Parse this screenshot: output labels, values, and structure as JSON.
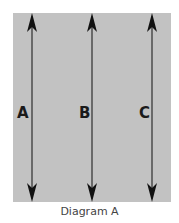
{
  "diagram": {
    "caption": "Diagram A",
    "background_color": "#c2c2c2",
    "arrow_color": "#111111",
    "arrows": [
      {
        "label": "A",
        "x": 32,
        "direction": "double-headed vertical"
      },
      {
        "label": "B",
        "x": 92,
        "direction": "double-headed vertical"
      },
      {
        "label": "C",
        "x": 152,
        "direction": "double-headed vertical"
      }
    ]
  }
}
